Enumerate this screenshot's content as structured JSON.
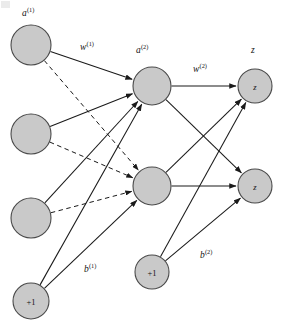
{
  "diagram": {
    "background_color": "#ffffff",
    "node_fill_color": "#c9c9c9",
    "node_stroke_color": "#4a4a4a",
    "edge_color": "#1a1a1a",
    "labels": {
      "input_activation": "a",
      "input_activation_sup": "(1)",
      "weights_1": "w",
      "weights_1_sup": "(1)",
      "hidden_activation": "a",
      "hidden_activation_sup": "(2)",
      "weights_2": "w",
      "weights_2_sup": "(2)",
      "output": "z",
      "bias_1": "b",
      "bias_1_sup": "(1)",
      "bias_2": "b",
      "bias_2_sup": "(2)"
    },
    "nodes": {
      "input_1": {
        "label": "",
        "cx": 31,
        "cy": 45,
        "r": 20
      },
      "input_2": {
        "label": "",
        "cx": 31,
        "cy": 134,
        "r": 20
      },
      "input_3": {
        "label": "",
        "cx": 31,
        "cy": 218,
        "r": 20
      },
      "input_bias": {
        "label": "+1",
        "cx": 31,
        "cy": 301,
        "r": 18
      },
      "hidden_1": {
        "label": "",
        "cx": 152,
        "cy": 86,
        "r": 19
      },
      "hidden_2": {
        "label": "",
        "cx": 152,
        "cy": 186,
        "r": 19
      },
      "hidden_bias": {
        "label": "+1",
        "cx": 152,
        "cy": 272,
        "r": 17
      },
      "output_1": {
        "label": "z",
        "cx": 255,
        "cy": 86,
        "r": 17
      },
      "output_2": {
        "label": "z",
        "cx": 255,
        "cy": 186,
        "r": 17
      }
    },
    "edges": [
      {
        "from": "input_1",
        "to": "hidden_1",
        "style": "solid"
      },
      {
        "from": "input_2",
        "to": "hidden_1",
        "style": "solid"
      },
      {
        "from": "input_3",
        "to": "hidden_1",
        "style": "solid"
      },
      {
        "from": "input_bias",
        "to": "hidden_1",
        "style": "solid"
      },
      {
        "from": "input_1",
        "to": "hidden_2",
        "style": "dashed"
      },
      {
        "from": "input_2",
        "to": "hidden_2",
        "style": "dashed"
      },
      {
        "from": "input_3",
        "to": "hidden_2",
        "style": "dashed"
      },
      {
        "from": "input_bias",
        "to": "hidden_2",
        "style": "solid"
      },
      {
        "from": "hidden_1",
        "to": "output_1",
        "style": "solid"
      },
      {
        "from": "hidden_1",
        "to": "output_2",
        "style": "solid"
      },
      {
        "from": "hidden_2",
        "to": "output_1",
        "style": "solid"
      },
      {
        "from": "hidden_2",
        "to": "output_2",
        "style": "solid"
      },
      {
        "from": "hidden_bias",
        "to": "output_1",
        "style": "solid"
      },
      {
        "from": "hidden_bias",
        "to": "output_2",
        "style": "solid"
      }
    ]
  }
}
